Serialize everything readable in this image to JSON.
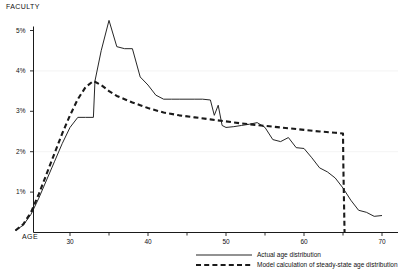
{
  "chart_data": {
    "type": "line",
    "title": "",
    "ylabel": "FACULTY",
    "xlabel": "AGE",
    "xlim": [
      22,
      71
    ],
    "ylim": [
      0,
      5.5
    ],
    "grid": false,
    "legend_position": "bottom-center",
    "y_ticks": [
      {
        "value": 1,
        "label": "1%"
      },
      {
        "value": 2,
        "label": "2%"
      },
      {
        "value": 3,
        "label": "3%"
      },
      {
        "value": 4,
        "label": "4%"
      },
      {
        "value": 5,
        "label": "5%"
      }
    ],
    "x_ticks": [
      {
        "value": 30,
        "label": "30"
      },
      {
        "value": 35,
        "label": ""
      },
      {
        "value": 40,
        "label": "40"
      },
      {
        "value": 45,
        "label": ""
      },
      {
        "value": 50,
        "label": "50"
      },
      {
        "value": 55,
        "label": ""
      },
      {
        "value": 60,
        "label": "60"
      },
      {
        "value": 65,
        "label": ""
      },
      {
        "value": 70,
        "label": "70"
      }
    ],
    "series": [
      {
        "name": "Actual age distribution",
        "style": "solid",
        "color": "#1a1a1a",
        "x": [
          23,
          24,
          25,
          26,
          27,
          28,
          29,
          30,
          31,
          32,
          33,
          33.2,
          34,
          35,
          36,
          37,
          38,
          39,
          40,
          41,
          42,
          43,
          44,
          45,
          46,
          47,
          48,
          48.5,
          49,
          49.5,
          50,
          51,
          52,
          53,
          54,
          55,
          56,
          57,
          58,
          59,
          60,
          61,
          62,
          63,
          64,
          65,
          66,
          67,
          68,
          69,
          70
        ],
        "y": [
          0.05,
          0.18,
          0.45,
          0.85,
          1.3,
          1.75,
          2.2,
          2.6,
          2.85,
          2.85,
          2.85,
          3.75,
          4.5,
          5.25,
          4.6,
          4.55,
          4.55,
          3.85,
          3.65,
          3.4,
          3.3,
          3.3,
          3.3,
          3.3,
          3.3,
          3.3,
          3.28,
          2.9,
          3.15,
          2.65,
          2.6,
          2.62,
          2.65,
          2.68,
          2.72,
          2.6,
          2.3,
          2.25,
          2.35,
          2.1,
          2.08,
          1.85,
          1.6,
          1.5,
          1.35,
          1.1,
          0.8,
          0.55,
          0.5,
          0.4,
          0.42
        ]
      },
      {
        "name": "Model calculation of steady-state age distribution",
        "style": "dashed",
        "color": "#1a1a1a",
        "x": [
          23,
          24,
          25,
          26,
          27,
          28,
          29,
          30,
          31,
          32,
          33,
          34,
          35,
          36,
          37,
          38,
          39,
          40,
          42,
          44,
          46,
          48,
          50,
          52,
          54,
          56,
          58,
          60,
          62,
          64,
          65,
          65.05,
          65.2
        ],
        "y": [
          0.05,
          0.2,
          0.5,
          0.95,
          1.45,
          1.95,
          2.45,
          2.9,
          3.3,
          3.6,
          3.75,
          3.65,
          3.5,
          3.38,
          3.3,
          3.22,
          3.15,
          3.08,
          2.97,
          2.9,
          2.85,
          2.8,
          2.75,
          2.7,
          2.66,
          2.62,
          2.58,
          2.54,
          2.5,
          2.47,
          2.45,
          1.6,
          0.0
        ]
      }
    ]
  },
  "legend": {
    "items": [
      {
        "label": "Actual age distribution",
        "style": "solid"
      },
      {
        "label": "Model calculation of steady-state age distribution",
        "style": "dashed"
      }
    ]
  }
}
